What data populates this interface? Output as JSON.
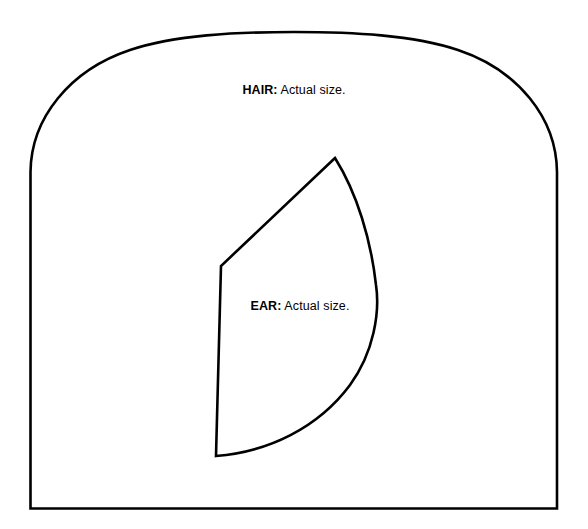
{
  "page": {
    "background_color": "#ffffff",
    "stroke_color": "#000000",
    "width": 588,
    "height": 529
  },
  "pieces": [
    {
      "id": "hair",
      "name_label": "HAIR:",
      "note_label": " Actual size.",
      "full_text": "HAIR: Actual size.",
      "shape": "arched-rectangle",
      "path": "M 30.5 508.5 L 30.5 172 C 31 118 70 70 130 50 C 175 35 235 32 294 32 C 353 32 413 35 458 50 C 518 70 556.5 118 557 172 L 557 508.5 Z"
    },
    {
      "id": "ear",
      "name_label": "EAR:",
      "note_label": " Actual size.",
      "full_text": "EAR: Actual size.",
      "shape": "leaf",
      "path": "M 335 158 L 221 266 L 216 456 C 268 452 318 428 350 385 C 374 352 380 312 376 285 C 371 240 357 193 335 158 Z"
    }
  ]
}
